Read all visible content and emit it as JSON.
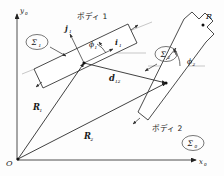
{
  "figure": {
    "background_color": "#fdfdfd",
    "line_color": "#2b2b2b",
    "reference_line_color": "#b9b9b9"
  },
  "axes": {
    "x_label": "x",
    "x_sub": "0",
    "y_label": "y",
    "y_sub": "0",
    "origin_label": "O"
  },
  "frames": [
    {
      "id": "sigma0",
      "label": "Σ0",
      "glyph": "Σ",
      "sub": "0",
      "desc": "global-frame"
    },
    {
      "id": "sigma1",
      "label": "Σ1",
      "glyph": "Σ",
      "sub": "1",
      "desc": "body1-frame"
    },
    {
      "id": "sigma2",
      "label": "Σ2",
      "glyph": "Σ",
      "sub": "2",
      "desc": "body2-frame"
    }
  ],
  "bodies": [
    {
      "id": "body1",
      "label": "ボディ 1",
      "desc": "Body 1"
    },
    {
      "id": "body2",
      "label": "ボディ 2",
      "desc": "Body 2"
    }
  ],
  "vectors": [
    {
      "id": "R1",
      "glyph": "R",
      "sub": "1",
      "desc": "position-vector-body1"
    },
    {
      "id": "R2",
      "glyph": "R",
      "sub": "2",
      "desc": "position-vector-body2"
    },
    {
      "id": "d12",
      "glyph": "d",
      "sub": "12",
      "desc": "relative-vector-body1-to-body2"
    },
    {
      "id": "i1",
      "glyph": "i",
      "sub": "1",
      "desc": "unit-vector-x-body1"
    },
    {
      "id": "j1",
      "glyph": "j",
      "sub": "1",
      "desc": "unit-vector-y-body1"
    }
  ],
  "angles": [
    {
      "id": "phi1",
      "glyph": "ϕ",
      "sub": "1",
      "desc": "orientation-angle-body1"
    },
    {
      "id": "phi2",
      "glyph": "ϕ",
      "sub": "2",
      "desc": "orientation-angle-body2"
    }
  ],
  "points": [
    {
      "id": "R",
      "label": "R",
      "desc": "marked-point-on-body2"
    }
  ]
}
